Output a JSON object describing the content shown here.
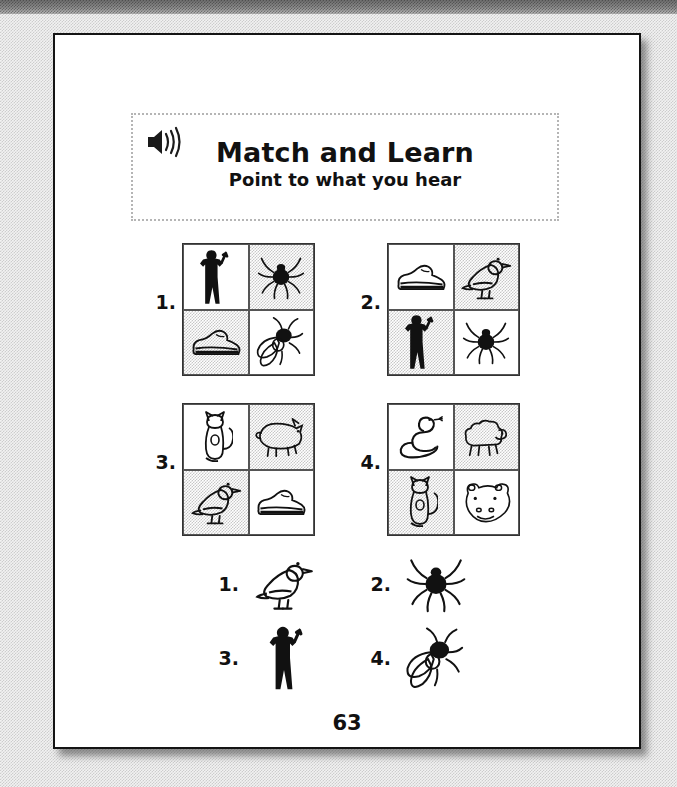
{
  "page": {
    "page_number": "63",
    "background_style": "scanned-halftone-gray"
  },
  "header": {
    "speaker_icon": "speaker-sound-icon",
    "title": "Match and Learn",
    "subtitle": "Point to what you hear"
  },
  "questions": [
    {
      "number": "1.",
      "cells": [
        {
          "icon": "man",
          "shaded": false
        },
        {
          "icon": "spider",
          "shaded": true
        },
        {
          "icon": "shoe",
          "shaded": true
        },
        {
          "icon": "fly",
          "shaded": false
        }
      ]
    },
    {
      "number": "2.",
      "cells": [
        {
          "icon": "shoe",
          "shaded": false
        },
        {
          "icon": "bird",
          "shaded": true
        },
        {
          "icon": "man",
          "shaded": true
        },
        {
          "icon": "spider",
          "shaded": false
        }
      ]
    },
    {
      "number": "3.",
      "cells": [
        {
          "icon": "cat",
          "shaded": false
        },
        {
          "icon": "pig",
          "shaded": true
        },
        {
          "icon": "bird",
          "shaded": true
        },
        {
          "icon": "shoe",
          "shaded": false
        }
      ]
    },
    {
      "number": "4.",
      "cells": [
        {
          "icon": "snake",
          "shaded": false
        },
        {
          "icon": "sheep",
          "shaded": true
        },
        {
          "icon": "cat",
          "shaded": true
        },
        {
          "icon": "hippo",
          "shaded": false
        }
      ]
    }
  ],
  "answer_key": [
    {
      "number": "1.",
      "icon": "bird"
    },
    {
      "number": "2.",
      "icon": "spider"
    },
    {
      "number": "3.",
      "icon": "man"
    },
    {
      "number": "4.",
      "icon": "fly"
    }
  ],
  "colors": {
    "ink": "#111111",
    "page_border": "#141414",
    "banner_border": "#b5b5b5",
    "cell_shade": "#9a9a9a",
    "scan_background": "#f2f2f2"
  }
}
